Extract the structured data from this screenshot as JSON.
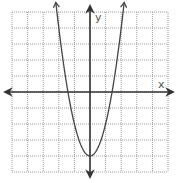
{
  "chart_data": {
    "type": "line",
    "title": "",
    "xlabel": "x",
    "ylabel": "y",
    "function": "y = 2x^2 - 4",
    "vertex": [
      0,
      -4
    ],
    "x_intercepts": [
      -1.414,
      1.414
    ],
    "xlim": [
      -5,
      5
    ],
    "ylim": [
      -5,
      5
    ],
    "grid": true,
    "grid_style": "dotted",
    "tick_step": 1,
    "tick_labels": [],
    "legend": null,
    "series": [
      {
        "name": "parabola",
        "x": [
          -2.24,
          -2,
          -1.5,
          -1.414,
          -1,
          -0.5,
          0,
          0.5,
          1,
          1.414,
          1.5,
          2,
          2.24
        ],
        "y": [
          6.0,
          4,
          0.5,
          0,
          -2,
          -3.5,
          -4,
          -3.5,
          -2,
          0,
          0.5,
          4,
          6.0
        ]
      }
    ]
  },
  "labels": {
    "x_axis": "x",
    "y_axis": "y"
  },
  "colors": {
    "axis": "#333333",
    "curve": "#444444",
    "grid": "#9a9a9a",
    "background": "#ffffff"
  }
}
